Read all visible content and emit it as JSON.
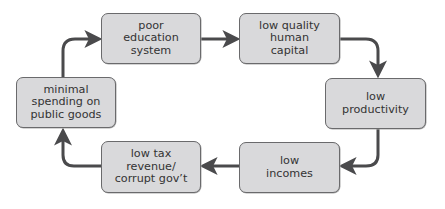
{
  "diagram": {
    "type": "cycle",
    "nodes": [
      {
        "id": "poor-education",
        "label": "poor\neducation\nsystem"
      },
      {
        "id": "low-human-capital",
        "label": "low quality\nhuman\ncapital"
      },
      {
        "id": "low-productivity",
        "label": "low\nproductivity"
      },
      {
        "id": "low-incomes",
        "label": "low\nincomes"
      },
      {
        "id": "low-tax",
        "label": "low tax\nrevenue/\ncorrupt gov’t"
      },
      {
        "id": "minimal-spending",
        "label": "minimal\nspending on\npublic goods"
      }
    ],
    "edges": [
      [
        "poor-education",
        "low-human-capital"
      ],
      [
        "low-human-capital",
        "low-productivity"
      ],
      [
        "low-productivity",
        "low-incomes"
      ],
      [
        "low-incomes",
        "low-tax"
      ],
      [
        "low-tax",
        "minimal-spending"
      ],
      [
        "minimal-spending",
        "poor-education"
      ]
    ],
    "colors": {
      "box_fill": "#d9d9db",
      "box_border": "#6a6a6c",
      "arrow": "#4a4a4c",
      "text": "#333333"
    }
  }
}
